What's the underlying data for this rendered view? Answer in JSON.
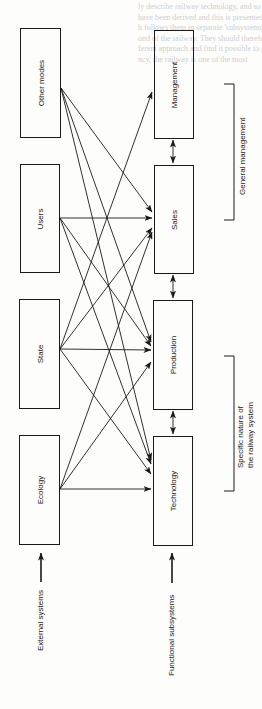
{
  "diagram": {
    "external_systems": {
      "label": "External systems",
      "boxes": [
        {
          "id": "other-modes",
          "label": "Other modes"
        },
        {
          "id": "users",
          "label": "Users"
        },
        {
          "id": "state",
          "label": "State"
        },
        {
          "id": "ecology",
          "label": "Ecology"
        }
      ]
    },
    "functional_subsystems": {
      "label": "Functional subsystems",
      "boxes": [
        {
          "id": "management",
          "label": "Management"
        },
        {
          "id": "sales",
          "label": "Sales"
        },
        {
          "id": "production",
          "label": "Production"
        },
        {
          "id": "technology",
          "label": "Technology"
        }
      ]
    },
    "brackets": [
      {
        "label": "General management",
        "spans": [
          "management",
          "sales"
        ]
      },
      {
        "label_line1": "Specific nature of",
        "label_line2": "the railway system",
        "spans": [
          "production",
          "technology"
        ]
      }
    ],
    "edges": [
      {
        "from": "other-modes",
        "to": "sales"
      },
      {
        "from": "other-modes",
        "to": "production"
      },
      {
        "from": "other-modes",
        "to": "technology"
      },
      {
        "from": "users",
        "to": "sales"
      },
      {
        "from": "users",
        "to": "production"
      },
      {
        "from": "users",
        "to": "technology"
      },
      {
        "from": "state",
        "to": "management"
      },
      {
        "from": "state",
        "to": "sales"
      },
      {
        "from": "state",
        "to": "production"
      },
      {
        "from": "state",
        "to": "technology"
      },
      {
        "from": "ecology",
        "to": "sales"
      },
      {
        "from": "ecology",
        "to": "production"
      },
      {
        "from": "ecology",
        "to": "technology"
      },
      {
        "from": "management",
        "to": "sales",
        "bidirectional": true
      },
      {
        "from": "sales",
        "to": "production",
        "bidirectional": true
      },
      {
        "from": "production",
        "to": "technology",
        "bidirectional": true
      }
    ],
    "background_text": [
      "ly describe railway technology, and so the",
      "have been derived and this is presented",
      "h follows them in separate 'subsystems'",
      "ond of the railway. They should therefore",
      "ferent approach and find it possible to go",
      "ncy, the railway is one of the most"
    ]
  }
}
